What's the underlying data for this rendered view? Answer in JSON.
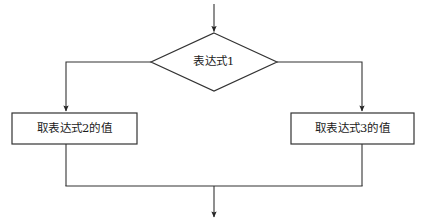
{
  "diagram": {
    "type": "flowchart",
    "title": "",
    "background_color": "#ffffff",
    "stroke_color": "#333333",
    "text_color": "#1a1a1a",
    "nodes": {
      "decision": {
        "shape": "diamond",
        "label": "表达式1"
      },
      "process_left": {
        "shape": "rectangle",
        "label": "取表达式2的值"
      },
      "process_right": {
        "shape": "rectangle",
        "label": "取表达式3的值"
      }
    },
    "connectors": {
      "entry_arrow": "entry-arrow-into-decision",
      "left_branch": "decision-left-to-process-left",
      "right_branch": "decision-right-to-process-right",
      "merge_rail": "merge-rail-bottom",
      "exit_arrow": "exit-arrow-down"
    }
  }
}
